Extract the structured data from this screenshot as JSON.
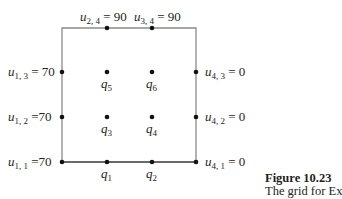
{
  "diagram": {
    "type": "finite-difference-grid",
    "frame": {
      "left": 62,
      "top": 28,
      "right": 196,
      "bottom": 162,
      "stroke": "#8a8a8a"
    },
    "columns_x": [
      62,
      107,
      152,
      196
    ],
    "rows_y": [
      28,
      72,
      117,
      162
    ],
    "boundary_nodes": [
      {
        "id": "u24",
        "var": "u",
        "sub": "2, 4",
        "value": "90",
        "text": "= 90"
      },
      {
        "id": "u34",
        "var": "u",
        "sub": "3, 4",
        "value": "90",
        "text": "= 90"
      },
      {
        "id": "u13",
        "var": "u",
        "sub": "1, 3",
        "value": "70",
        "text": "= 70"
      },
      {
        "id": "u12",
        "var": "u",
        "sub": "1, 2",
        "value": "70",
        "text": "=70"
      },
      {
        "id": "u11",
        "var": "u",
        "sub": "1, 1",
        "value": "70",
        "text": "=70"
      },
      {
        "id": "u43",
        "var": "u",
        "sub": "4, 3",
        "value": "0",
        "text": "= 0"
      },
      {
        "id": "u42",
        "var": "u",
        "sub": "4, 2",
        "value": "0",
        "text": "= 0"
      },
      {
        "id": "u41",
        "var": "u",
        "sub": "4, 1",
        "value": "0",
        "text": "= 0"
      }
    ],
    "unknowns": [
      {
        "id": "q1",
        "var": "q",
        "sub": "1"
      },
      {
        "id": "q2",
        "var": "q",
        "sub": "2"
      },
      {
        "id": "q3",
        "var": "q",
        "sub": "3"
      },
      {
        "id": "q4",
        "var": "q",
        "sub": "4"
      },
      {
        "id": "q5",
        "var": "q",
        "sub": "5"
      },
      {
        "id": "q6",
        "var": "q",
        "sub": "6"
      }
    ]
  },
  "caption": {
    "title": "Figure 10.23",
    "text": "The grid for Ex"
  }
}
